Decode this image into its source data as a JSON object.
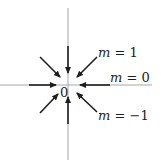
{
  "diagram": {
    "type": "phase-portrait-star-node",
    "colors": {
      "axis": "#a8a8a8",
      "arrow": "#1e1e1e",
      "text": "#1e1e1e",
      "background": "#ffffff"
    },
    "axes": {
      "horizontal": {
        "x1": 0,
        "y1": 85,
        "x2": 152,
        "y2": 85
      },
      "vertical": {
        "x1": 68,
        "y1": 8,
        "x2": 68,
        "y2": 160
      }
    },
    "origin": {
      "label": "0",
      "x": 60,
      "y": 97
    },
    "arrows": [
      {
        "name": "top",
        "x1": 68,
        "y1": 46,
        "x2": 68,
        "y2": 73
      },
      {
        "name": "bottom",
        "x1": 68,
        "y1": 124,
        "x2": 68,
        "y2": 97
      },
      {
        "name": "left",
        "x1": 29,
        "y1": 85,
        "x2": 56,
        "y2": 85
      },
      {
        "name": "right",
        "x1": 110,
        "y1": 85,
        "x2": 80,
        "y2": 85
      },
      {
        "name": "upper-left",
        "x1": 40,
        "y1": 57,
        "x2": 60,
        "y2": 77
      },
      {
        "name": "upper-right",
        "x1": 97,
        "y1": 57,
        "x2": 77,
        "y2": 77
      },
      {
        "name": "lower-left",
        "x1": 40,
        "y1": 113,
        "x2": 58,
        "y2": 94
      },
      {
        "name": "lower-right",
        "x1": 97,
        "y1": 112,
        "x2": 77,
        "y2": 93
      }
    ],
    "labels": [
      {
        "id": "m1",
        "var": "m",
        "eq": " = 1",
        "x": 98,
        "y": 57
      },
      {
        "id": "m0",
        "var": "m",
        "eq": " = 0",
        "x": 110,
        "y": 82
      },
      {
        "id": "mneg1",
        "var": "m",
        "eq": " = −1",
        "x": 98,
        "y": 120
      }
    ]
  }
}
